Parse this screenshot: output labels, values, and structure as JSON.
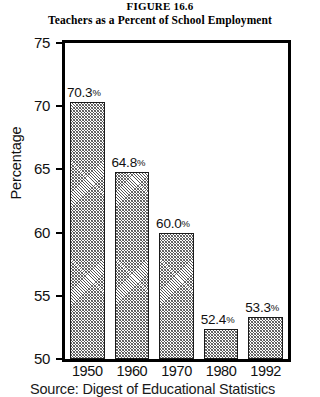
{
  "figure": {
    "number": "FIGURE 16.6",
    "title": "Teachers as a Percent of School Employment",
    "source_note": "Source: Digest of Educational Statistics"
  },
  "axes": {
    "y_title": "Percentage",
    "y_ticks": [
      "75",
      "70",
      "65",
      "60",
      "55",
      "50"
    ],
    "x_ticks": [
      "1950",
      "1960",
      "1970",
      "1980",
      "1992"
    ]
  },
  "bars": [
    {
      "year": "1950",
      "value": 70.3,
      "label": "70.3",
      "pct": "%"
    },
    {
      "year": "1960",
      "value": 64.8,
      "label": "64.8",
      "pct": "%"
    },
    {
      "year": "1970",
      "value": 60.0,
      "label": "60.0",
      "pct": "%"
    },
    {
      "year": "1980",
      "value": 52.4,
      "label": "52.4",
      "pct": "%"
    },
    {
      "year": "1992",
      "value": 53.3,
      "label": "53.3",
      "pct": "%"
    }
  ],
  "chart_data": {
    "type": "bar",
    "title": "Teachers as a Percent of School Employment",
    "subtitle": "FIGURE 16.6",
    "categories": [
      "1950",
      "1960",
      "1970",
      "1980",
      "1992"
    ],
    "values": [
      70.3,
      64.8,
      60.0,
      52.4,
      53.3
    ],
    "data_labels": [
      "70.3%",
      "64.8%",
      "60.0%",
      "52.4%",
      "53.3%"
    ],
    "xlabel": "",
    "ylabel": "Percentage",
    "ylim": [
      50,
      75
    ],
    "yticks": [
      50,
      55,
      60,
      65,
      70,
      75
    ],
    "grid": false,
    "legend": false,
    "bar_fill": "diagonal-hatch",
    "bar_edge_color": "#1a1a1a",
    "frame_color": "#000000",
    "background": "#ffffff",
    "source": "Source: Digest of Educational Statistics"
  }
}
